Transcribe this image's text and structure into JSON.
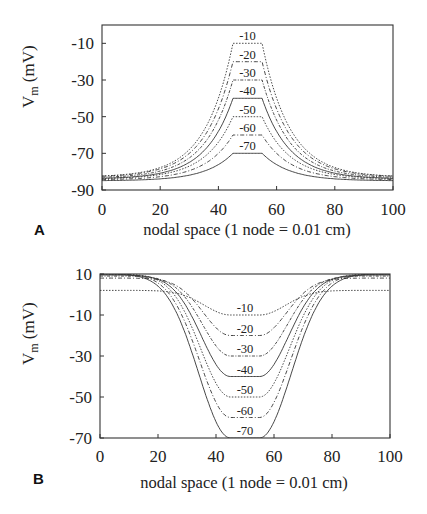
{
  "chart_data": [
    {
      "panel": "A",
      "type": "line",
      "title": "",
      "xlabel": "nodal space (1 node = 0.01 cm)",
      "ylabel": "V_m (mV)",
      "xlim": [
        0,
        100
      ],
      "ylim": [
        -90,
        0
      ],
      "xticks": [
        0,
        20,
        40,
        60,
        80,
        100
      ],
      "yticks": [
        -10,
        -30,
        -50,
        -70,
        -90
      ],
      "grid": false,
      "legend": "inline labels above plateaus",
      "plateau_x": [
        45,
        55
      ],
      "series": [
        {
          "name": "-10",
          "plateau": -10,
          "edge": -83,
          "dash": "1.5,1.5"
        },
        {
          "name": "-20",
          "plateau": -20,
          "edge": -83,
          "dash": "4,2,1,2"
        },
        {
          "name": "-30",
          "plateau": -30,
          "edge": -83.5,
          "dash": "3,1.5,1,1.5"
        },
        {
          "name": "-40",
          "plateau": -40,
          "edge": -84,
          "dash": ""
        },
        {
          "name": "-50",
          "plateau": -50,
          "edge": -84,
          "dash": "1.5,1.5"
        },
        {
          "name": "-60",
          "plateau": -60,
          "edge": -84.5,
          "dash": "4,2,1,2"
        },
        {
          "name": "-70",
          "plateau": -70,
          "edge": -85,
          "dash": ""
        }
      ]
    },
    {
      "panel": "B",
      "type": "line",
      "title": "",
      "xlabel": "nodal space (1 node = 0.01 cm)",
      "ylabel": "V_m (mV)",
      "xlim": [
        0,
        100
      ],
      "ylim": [
        -70,
        10
      ],
      "xticks": [
        0,
        20,
        40,
        60,
        80,
        100
      ],
      "yticks": [
        10,
        -10,
        -30,
        -50,
        -70
      ],
      "grid": false,
      "legend": "inline labels above plateaus",
      "plateau_x": [
        45,
        55
      ],
      "series": [
        {
          "name": "-10",
          "plateau": -10,
          "edge": 2,
          "dash": "1.5,1.5"
        },
        {
          "name": "-20",
          "plateau": -20,
          "edge": 8,
          "dash": "4,2,1,2"
        },
        {
          "name": "-30",
          "plateau": -30,
          "edge": 9,
          "dash": "3,1.5,1,1.5"
        },
        {
          "name": "-40",
          "plateau": -40,
          "edge": 9.5,
          "dash": ""
        },
        {
          "name": "-50",
          "plateau": -50,
          "edge": 10,
          "dash": "1.5,1.5"
        },
        {
          "name": "-60",
          "plateau": -60,
          "edge": 10,
          "dash": "4,2,1,2"
        },
        {
          "name": "-70",
          "plateau": -70,
          "edge": 10,
          "dash": ""
        }
      ]
    }
  ],
  "panels": {
    "A": {
      "letter": "A",
      "xlabel": "nodal space (1 node = 0.01 cm)",
      "ylabel_main": "V",
      "ylabel_sub": "m",
      "ylabel_unit": " (mV)"
    },
    "B": {
      "letter": "B",
      "xlabel": "nodal space (1 node = 0.01 cm)",
      "ylabel_main": "V",
      "ylabel_sub": "m",
      "ylabel_unit": " (mV)"
    }
  }
}
